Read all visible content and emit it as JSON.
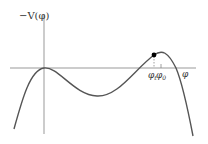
{
  "diagram": {
    "y_axis_label": "−V(φ)",
    "x_axis_label": "φ",
    "markers": [
      {
        "symbol": "φ",
        "subscript": "t"
      },
      {
        "symbol": "φ",
        "subscript": "0"
      }
    ],
    "colors": {
      "curve": "#555555",
      "axes": "#888888",
      "dot": "#000000",
      "text": "#333333"
    }
  }
}
